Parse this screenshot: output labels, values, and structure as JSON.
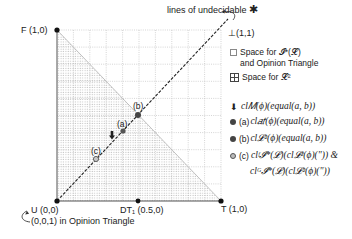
{
  "diagram": {
    "line_label": "lines of undecidable",
    "line_label_star": "✱",
    "corners": {
      "F": "F (1,0)",
      "U": "U (0,0)",
      "U_sub": "(0,0,1) in Opinion Triangle",
      "T": "T (1,0)",
      "top": "⊥(1,1)",
      "DT1": "DT₁ (0.5,0)"
    },
    "points": {
      "a": "(a)",
      "b": "(b)",
      "c": "(c)"
    }
  },
  "legend": {
    "space_i": "Space for 𝓘*(𝓛)",
    "space_i_line2": "and Opinion Triangle",
    "space_l2": "Space for 𝓛²",
    "arrow_item": "cl𝑀(ϕ)(equal(a, b))",
    "a_prefix": "(a)",
    "a_item": "cl𝑎𝑡(ϕ)(equal(a, b))",
    "b_prefix": "(b)",
    "b_item": "cl𝓛²(ϕ)(equal(a, b))",
    "c_prefix": "(c)",
    "c_item1": "clᶠ𝓘*(𝓛)(cl𝓛²(ϕ)(\")) &",
    "c_item2": "clᴳ𝓘*(𝓛)(cl𝓛²(ϕ)(\"))"
  },
  "colors": {
    "grid": "#b8b8b8",
    "points": "#333333",
    "shade_dot": "#8a8a8a"
  }
}
